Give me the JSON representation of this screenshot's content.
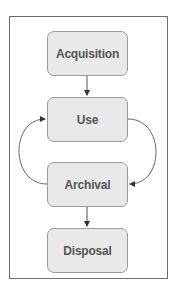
{
  "diagram": {
    "nodes": [
      {
        "id": "acquisition",
        "label": "Acquisition"
      },
      {
        "id": "use",
        "label": "Use"
      },
      {
        "id": "archival",
        "label": "Archival"
      },
      {
        "id": "disposal",
        "label": "Disposal"
      }
    ],
    "edges": [
      {
        "from": "Acquisition",
        "to": "Use"
      },
      {
        "from": "Use",
        "to": "Archival"
      },
      {
        "from": "Archival",
        "to": "Use"
      },
      {
        "from": "Archival",
        "to": "Disposal"
      }
    ],
    "colors": {
      "node_fill": "#e9e9e9",
      "node_border": "#9a9a9a",
      "text": "#555555",
      "frame": "#6e6e6e"
    }
  }
}
